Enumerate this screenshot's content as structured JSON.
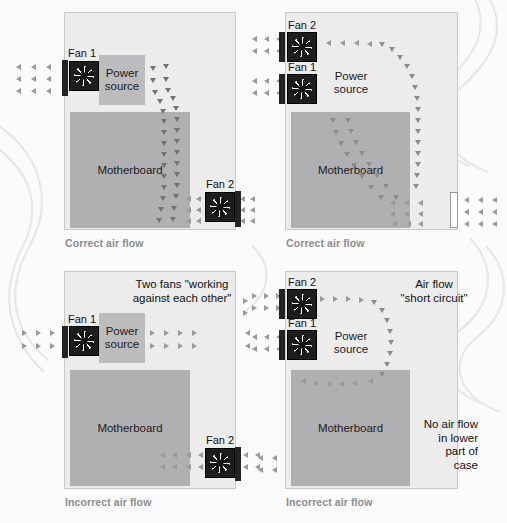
{
  "diagram": {
    "colors": {
      "case_fill": "#ececed",
      "case_border": "#c9c9cb",
      "motherboard": "#b0b0b2",
      "power_source": "#bcbcbe",
      "fan_body": "#1d1d1d",
      "arrow": "#9a9a9c",
      "caption": "#8d8d8f",
      "background": "#fbfbfb"
    },
    "panels": [
      {
        "id": "top-left",
        "caption": "Correct air flow",
        "components": {
          "motherboard_label": "Motherboard",
          "power_source_label": "Power\nsource",
          "fans": [
            {
              "name": "Fan 1",
              "position": "upper-left-intake"
            },
            {
              "name": "Fan 2",
              "position": "lower-right-exhaust"
            }
          ]
        },
        "notes": []
      },
      {
        "id": "top-right",
        "caption": "Correct air flow",
        "components": {
          "motherboard_label": "Motherboard",
          "power_source_label": "Power\nsource",
          "fans": [
            {
              "name": "Fan 2",
              "position": "upper-left-intake"
            },
            {
              "name": "Fan 1",
              "position": "left-intake"
            }
          ],
          "vent_label": "right-side-vent"
        },
        "notes": []
      },
      {
        "id": "bottom-left",
        "caption": "Incorrect air flow",
        "components": {
          "motherboard_label": "Motherboard",
          "power_source_label": "Power\nsource",
          "fans": [
            {
              "name": "Fan 1",
              "position": "upper-left-intake"
            },
            {
              "name": "Fan 2",
              "position": "lower-right-intake"
            }
          ]
        },
        "notes": [
          {
            "id": "opposing-fans",
            "text": "Two fans \"working\nagainst each other\""
          }
        ]
      },
      {
        "id": "bottom-right",
        "caption": "Incorrect air flow",
        "components": {
          "motherboard_label": "Motherboard",
          "power_source_label": "Power\nsource",
          "fans": [
            {
              "name": "Fan 2",
              "position": "upper-left-exhaust"
            },
            {
              "name": "Fan 1",
              "position": "left-intake"
            }
          ]
        },
        "notes": [
          {
            "id": "short-circuit",
            "text": "Air flow\n\"short circuit\""
          },
          {
            "id": "no-lower-flow",
            "text": "No air flow\nin lower\npart of\ncase"
          }
        ]
      }
    ]
  }
}
